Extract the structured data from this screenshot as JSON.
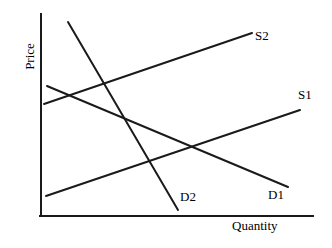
{
  "chart_data": {
    "type": "line",
    "title": "",
    "xlabel": "Quantity",
    "ylabel": "Price",
    "grid": false,
    "legend_position": "inline-end-of-curve",
    "axis_style": "arrowless-open-axes",
    "xlim": [
      0,
      100
    ],
    "ylim": [
      0,
      100
    ],
    "axes": {
      "y_axis": {
        "x": 41,
        "y_top": 14,
        "y_bottom": 216
      },
      "x_axis": {
        "y": 216,
        "x_left": 41,
        "x_right": 313
      }
    },
    "series": [
      {
        "name": "S1",
        "role": "supply-original",
        "slope": "upward",
        "color": "#1a1a1a",
        "points": [
          {
            "x": 46,
            "y": 196
          },
          {
            "x": 300,
            "y": 110
          }
        ],
        "label": "S1",
        "label_position": {
          "x": 298,
          "y": 88
        }
      },
      {
        "name": "S2",
        "role": "supply-shifted",
        "slope": "upward",
        "color": "#1a1a1a",
        "points": [
          {
            "x": 44,
            "y": 104
          },
          {
            "x": 252,
            "y": 33
          }
        ],
        "label": "S2",
        "label_position": {
          "x": 255,
          "y": 29
        }
      },
      {
        "name": "D1",
        "role": "demand-original",
        "slope": "downward",
        "color": "#1a1a1a",
        "points": [
          {
            "x": 47,
            "y": 86
          },
          {
            "x": 288,
            "y": 187
          }
        ],
        "label": "D1",
        "label_position": {
          "x": 268,
          "y": 188
        }
      },
      {
        "name": "D2",
        "role": "demand-shifted",
        "slope": "downward-steep",
        "color": "#1a1a1a",
        "points": [
          {
            "x": 68,
            "y": 22
          },
          {
            "x": 178,
            "y": 210
          }
        ],
        "label": "D2",
        "label_position": {
          "x": 180,
          "y": 190
        }
      }
    ],
    "annotations": []
  },
  "labels": {
    "s1": "S1",
    "s2": "S2",
    "d1": "D1",
    "d2": "D2",
    "quantity": "Quantity",
    "price": "Price"
  },
  "colors": {
    "line": "#1a1a1a",
    "axis": "#1a1a1a",
    "background": "#ffffff",
    "text": "#000000"
  }
}
